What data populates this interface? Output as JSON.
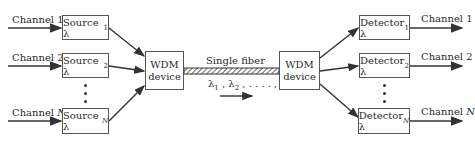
{
  "diagram": {
    "title": "",
    "inputs": [
      {
        "label": "Channel 1",
        "italic_part": ""
      },
      {
        "label": "Channel 2",
        "italic_part": ""
      },
      {
        "label": "Channel ",
        "italic_part": "N"
      }
    ],
    "sources": [
      {
        "label": "Source λ",
        "sub": "1"
      },
      {
        "label": "Source λ",
        "sub": "2"
      },
      {
        "label": "Source λ",
        "sub": "N"
      }
    ],
    "mux": {
      "line1": "WDM",
      "line2": "device"
    },
    "fiber": {
      "label": "Single fiber",
      "wavelengths": "λ1 , λ2 , . . . . , λN",
      "direction": "left-to-right"
    },
    "demux": {
      "line1": "WDM",
      "line2": "device"
    },
    "detectors": [
      {
        "label": "Detector λ",
        "sub": "1"
      },
      {
        "label": "Detector λ",
        "sub": "2"
      },
      {
        "label": "Detector λ",
        "sub": "N"
      }
    ],
    "outputs": [
      {
        "label": "Channel 1",
        "italic_part": ""
      },
      {
        "label": "Channel 2",
        "italic_part": ""
      },
      {
        "label": "Channel ",
        "italic_part": "N"
      }
    ],
    "ellipsis": "⋮",
    "colors": {
      "line": "#333333",
      "box_border": "#555555",
      "background": "#ffffff"
    }
  }
}
